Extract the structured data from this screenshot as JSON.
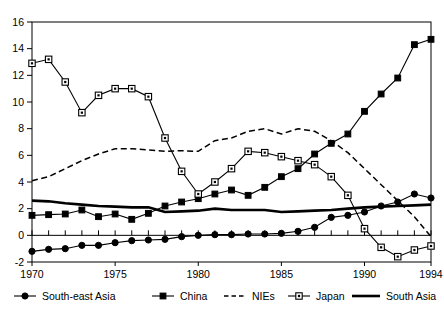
{
  "chart_data": {
    "type": "line",
    "title": "",
    "subtitle": "",
    "xlabel": "",
    "ylabel": "",
    "xlim": [
      1970,
      1994
    ],
    "ylim": [
      -2,
      16
    ],
    "yticks": [
      -2,
      0,
      2,
      4,
      6,
      8,
      10,
      12,
      14,
      16
    ],
    "ytick_labels": [
      "-2",
      "0",
      "2",
      "4",
      "6",
      "8",
      "10",
      "12",
      "14",
      "16"
    ],
    "xticks": [
      1970,
      1975,
      1980,
      1985,
      1990,
      1994
    ],
    "xtick_labels": [
      "1970",
      "1975",
      "1980",
      "1985",
      "1990",
      "1994"
    ],
    "x": [
      1970,
      1971,
      1972,
      1973,
      1974,
      1975,
      1976,
      1977,
      1978,
      1979,
      1980,
      1981,
      1982,
      1983,
      1984,
      1985,
      1986,
      1987,
      1988,
      1989,
      1990,
      1991,
      1992,
      1993,
      1994
    ],
    "grid": false,
    "legend_position": "bottom",
    "series": [
      {
        "name": "South-east Asia",
        "style": "solid-filled-circle",
        "marker": "filled-circle",
        "values": [
          -1.2,
          -1.05,
          -1.0,
          -0.75,
          -0.75,
          -0.55,
          -0.4,
          -0.35,
          -0.3,
          -0.1,
          0.0,
          0.05,
          0.05,
          0.1,
          0.1,
          0.15,
          0.3,
          0.6,
          1.35,
          1.5,
          1.75,
          2.2,
          2.5,
          3.1,
          2.8
        ]
      },
      {
        "name": "China",
        "style": "solid-filled-square",
        "marker": "filled-square",
        "values": [
          1.5,
          1.55,
          1.6,
          1.9,
          1.4,
          1.6,
          1.2,
          1.65,
          2.2,
          2.5,
          2.75,
          3.1,
          3.4,
          3.0,
          3.6,
          4.4,
          5.0,
          6.1,
          6.9,
          7.6,
          9.3,
          10.6,
          11.8,
          14.3,
          14.7
        ]
      },
      {
        "name": "NIEs",
        "style": "dashed",
        "marker": "none",
        "values": [
          4.1,
          4.4,
          5.0,
          5.6,
          6.1,
          6.5,
          6.5,
          6.4,
          6.3,
          6.35,
          6.3,
          7.1,
          7.3,
          7.8,
          8.0,
          7.6,
          8.0,
          7.8,
          7.1,
          6.2,
          5.0,
          3.8,
          2.6,
          1.4,
          -0.1
        ]
      },
      {
        "name": "Japan",
        "style": "solid-open-square",
        "marker": "open-square",
        "values": [
          12.9,
          13.2,
          11.5,
          9.2,
          10.5,
          11.0,
          11.0,
          10.4,
          7.3,
          4.8,
          3.1,
          4.0,
          5.0,
          6.3,
          6.2,
          5.9,
          5.6,
          5.3,
          4.4,
          3.0,
          0.5,
          -0.9,
          -1.6,
          -1.1,
          -0.8
        ]
      },
      {
        "name": "South Asia",
        "style": "solid-thick",
        "marker": "none",
        "values": [
          2.6,
          2.55,
          2.4,
          2.3,
          2.2,
          2.15,
          2.1,
          2.1,
          1.75,
          1.8,
          1.85,
          2.0,
          1.9,
          1.9,
          1.9,
          1.75,
          1.8,
          1.85,
          1.9,
          2.0,
          2.1,
          2.15,
          2.2,
          2.25,
          2.3
        ]
      }
    ]
  },
  "legend": {
    "items": [
      {
        "label": "South-east Asia",
        "marker": "filled-circle"
      },
      {
        "label": "China",
        "marker": "filled-square"
      },
      {
        "label": "NIEs",
        "marker": "dashed"
      },
      {
        "label": "Japan",
        "marker": "open-square"
      },
      {
        "label": "South Asia",
        "marker": "thick-line"
      }
    ]
  },
  "colors": {
    "line": "#000000",
    "background": "#ffffff",
    "frame": "#000000"
  }
}
